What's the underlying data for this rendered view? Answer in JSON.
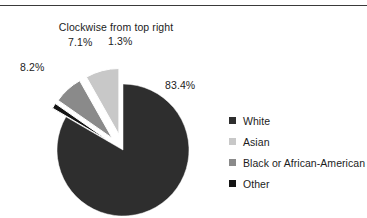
{
  "figure": {
    "subtitle": "Clockwise from top right",
    "top_rule_color": "#3a3a3a",
    "background": "#ffffff"
  },
  "legend": {
    "position": "right",
    "items": [
      {
        "label": "White",
        "color": "#2e2e2e",
        "swatch": "square-swatch"
      },
      {
        "label": "Asian",
        "color": "#c8c8c8",
        "swatch": "square-swatch"
      },
      {
        "label": "Black or African-American",
        "color": "#8a8a8a",
        "swatch": "square-swatch"
      },
      {
        "label": "Other",
        "color": "#141414",
        "swatch": "square-swatch"
      }
    ]
  },
  "labels": {
    "white": "83.4%",
    "other": "1.3%",
    "black": "7.1%",
    "asian": "8.2%"
  },
  "chart_data": {
    "type": "pie",
    "title": "",
    "subtitle": "Clockwise from top right",
    "xlabel": "",
    "ylabel": "",
    "start_angle_deg": 0,
    "direction": "clockwise",
    "units": "percent",
    "legend_position": "right",
    "grid": false,
    "categories": [
      "White",
      "Other",
      "Black or African-American",
      "Asian"
    ],
    "values": [
      83.4,
      1.3,
      7.1,
      8.2
    ],
    "colors": [
      "#2e2e2e",
      "#141414",
      "#8a8a8a",
      "#c8c8c8"
    ],
    "exploded": [
      false,
      true,
      true,
      true
    ],
    "labels": [
      "83.4%",
      "1.3%",
      "7.1%",
      "8.2%"
    ],
    "slices": [
      {
        "name": "White",
        "value": 83.4,
        "label": "83.4%",
        "color": "#2e2e2e",
        "exploded": false
      },
      {
        "name": "Other",
        "value": 1.3,
        "label": "1.3%",
        "color": "#141414",
        "exploded": true
      },
      {
        "name": "Black or African-American",
        "value": 7.1,
        "label": "7.1%",
        "color": "#8a8a8a",
        "exploded": true
      },
      {
        "name": "Asian",
        "value": 8.2,
        "label": "8.2%",
        "color": "#c8c8c8",
        "exploded": true
      }
    ]
  }
}
